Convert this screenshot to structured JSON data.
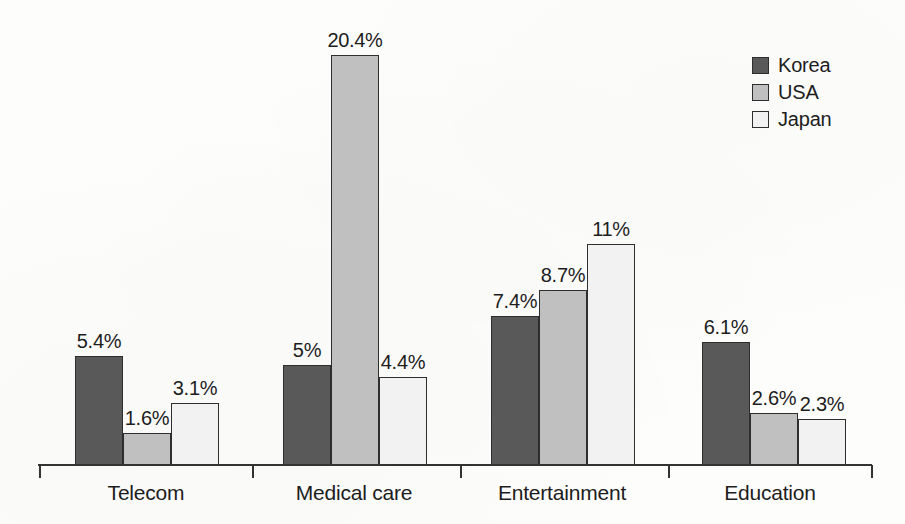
{
  "chart_data": {
    "type": "bar",
    "title": "",
    "subtitle": "",
    "xlabel": "",
    "ylabel": "",
    "categories": [
      "Telecom",
      "Medical care",
      "Entertainment",
      "Education"
    ],
    "series": [
      {
        "name": "Korea",
        "color": "#595959",
        "values": [
          5.4,
          5,
          7.4,
          6.1
        ],
        "labels": [
          "5.4%",
          "5%",
          "7.4%",
          "6.1%"
        ]
      },
      {
        "name": "USA",
        "color": "#c0c0c0",
        "values": [
          1.6,
          20.4,
          8.7,
          2.6
        ],
        "labels": [
          "1.6%",
          "20.4%",
          "8.7%",
          "2.6%"
        ]
      },
      {
        "name": "Japan",
        "color": "#f2f2f2",
        "values": [
          3.1,
          4.4,
          11,
          2.3
        ],
        "labels": [
          "3.1%",
          "4.4%",
          "11%",
          "2.3%"
        ]
      }
    ],
    "ylim": [
      0,
      20.4
    ],
    "grid": false,
    "legend_position": "top-right",
    "value_unit": "%",
    "axis_color": "#333333",
    "bar_outline_color": "#2e2e2e",
    "background_color": "#fdfdfc"
  },
  "legend": {
    "entries": [
      {
        "label": "Korea",
        "color": "#595959"
      },
      {
        "label": "USA",
        "color": "#c0c0c0"
      },
      {
        "label": "Japan",
        "color": "#f2f2f2"
      }
    ]
  },
  "axis": {
    "categories": [
      "Telecom",
      "Medical care",
      "Entertainment",
      "Education"
    ]
  }
}
